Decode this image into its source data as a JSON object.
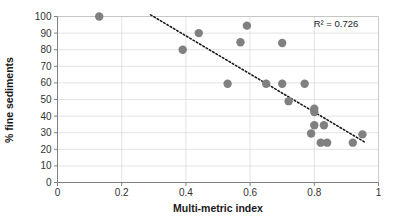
{
  "chart_data": {
    "type": "scatter",
    "title": "",
    "xlabel": "Multi-metric index",
    "ylabel": "% fine sediments",
    "xlim": [
      0,
      1
    ],
    "ylim": [
      0,
      100
    ],
    "xticks": [
      "0",
      "0.2",
      "0.4",
      "0.6",
      "0.8",
      "1"
    ],
    "xtick_values": [
      0,
      0.2,
      0.4,
      0.6,
      0.8,
      1
    ],
    "yticks": [
      "0",
      "10",
      "20",
      "30",
      "40",
      "50",
      "60",
      "70",
      "80",
      "90",
      "100"
    ],
    "ytick_values": [
      0,
      10,
      20,
      30,
      40,
      50,
      60,
      70,
      80,
      90,
      100
    ],
    "grid": "horizontal-and-vertical",
    "legend": "none",
    "marker_color": "#808080",
    "annotation": "R² = 0.726",
    "r_squared": 0.726,
    "points": [
      {
        "x": 0.13,
        "y": 100
      },
      {
        "x": 0.39,
        "y": 80
      },
      {
        "x": 0.44,
        "y": 90
      },
      {
        "x": 0.53,
        "y": 59.5
      },
      {
        "x": 0.57,
        "y": 84.5
      },
      {
        "x": 0.59,
        "y": 94.5
      },
      {
        "x": 0.65,
        "y": 59.5
      },
      {
        "x": 0.7,
        "y": 84
      },
      {
        "x": 0.7,
        "y": 59.5
      },
      {
        "x": 0.72,
        "y": 49
      },
      {
        "x": 0.77,
        "y": 59.5
      },
      {
        "x": 0.79,
        "y": 29.5
      },
      {
        "x": 0.8,
        "y": 44.5
      },
      {
        "x": 0.8,
        "y": 42.5
      },
      {
        "x": 0.8,
        "y": 34.5
      },
      {
        "x": 0.83,
        "y": 34.5
      },
      {
        "x": 0.82,
        "y": 24
      },
      {
        "x": 0.84,
        "y": 24
      },
      {
        "x": 0.92,
        "y": 24
      },
      {
        "x": 0.95,
        "y": 29
      }
    ],
    "trendline": {
      "style": "dotted",
      "color": "#1a1a1a",
      "x_start": 0.29,
      "y_start": 101,
      "x_end": 0.96,
      "y_end": 24
    }
  }
}
